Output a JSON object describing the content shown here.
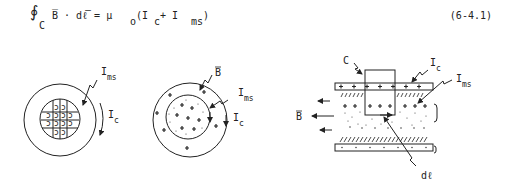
{
  "equation": {
    "integral": "∮",
    "subscript": "C",
    "lhs": "B̅ · dℓ̅ = μ",
    "mu_sub": "o",
    "open": "(I",
    "ic_sub": "c",
    "plus": " + I",
    "ims_sub": "ms",
    "close": ")",
    "number": "(6-4.1)"
  },
  "figure_left": {
    "label_ims": "I",
    "label_ims_sub": "ms",
    "label_ic": "I",
    "label_ic_sub": "c"
  },
  "figure_middle": {
    "label_b": "B",
    "label_ims": "I",
    "label_ims_sub": "ms",
    "label_ic": "I",
    "label_ic_sub": "c"
  },
  "figure_right": {
    "label_c": "C",
    "label_ic": "I",
    "label_ic_sub": "c",
    "label_ims": "I",
    "label_ims_sub": "ms",
    "label_b": "B",
    "label_dl": "dℓ"
  }
}
